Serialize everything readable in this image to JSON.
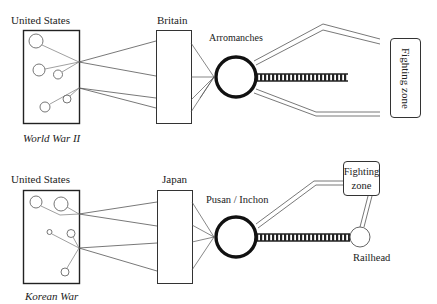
{
  "ww2": {
    "origin_label": "United States",
    "intermediate_label": "Britain",
    "port_label": "Arromanches",
    "destination_label": "Fighting zone",
    "caption": "World War II"
  },
  "korea": {
    "origin_label": "United States",
    "intermediate_label": "Japan",
    "port_label": "Pusan / Inchon",
    "destination_line1": "Fighting",
    "destination_line2": "zone",
    "railhead_label": "Railhead",
    "caption": "Korean War"
  },
  "colors": {
    "line": "#555555",
    "port_ring": "#111111",
    "rail": "#222222"
  }
}
